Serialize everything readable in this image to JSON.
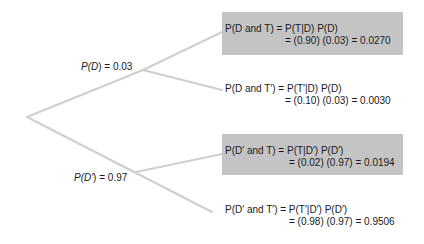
{
  "diagram": {
    "type": "probability-tree",
    "branches": [
      {
        "label": "P(D) = 0.03",
        "label_parts": {
          "p": "P(",
          "v": "D",
          "c": ") = 0.03"
        }
      },
      {
        "label": "P(D′) = 0.97",
        "label_parts": {
          "p": "P(",
          "v": "D′",
          "c": ") = 0.97"
        }
      }
    ],
    "outcomes": [
      {
        "highlighted": true,
        "line1": "P(D and T) = P(T|D) P(D)",
        "line2": "= (0.90) (0.03) = 0.0270"
      },
      {
        "highlighted": false,
        "line1": "P(D and T′) = P(T′|D) P(D)",
        "line2": "= (0.10) (0.03) = 0.0030"
      },
      {
        "highlighted": true,
        "line1": "P(D′ and T) = P(T|D′) P(D′)",
        "line2": "= (0.02) (0.97) = 0.0194"
      },
      {
        "highlighted": false,
        "line1": "P(D′ and T′) = P(T′|D′) P(D′)",
        "line2": "= (0.98) (0.97) = 0.9506"
      }
    ],
    "colors": {
      "line": "#cfcfcf",
      "highlight_box": "#c4c4c4",
      "text": "#1a1a1a"
    }
  }
}
